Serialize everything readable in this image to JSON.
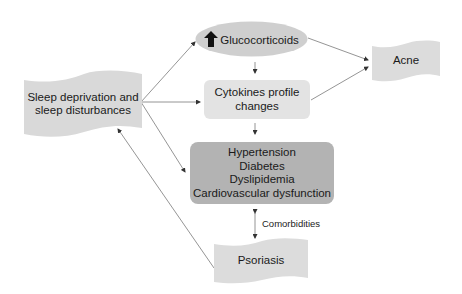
{
  "diagram": {
    "nodes": {
      "sleep": {
        "label_line1": "Sleep deprivation and",
        "label_line2": "sleep disturbances",
        "shape": "wave",
        "fill": "#d9d9d9"
      },
      "glucocorticoids": {
        "label": "Glucocorticoids",
        "prefix_icon": "up-arrow-icon",
        "shape": "ellipse",
        "fill": "#cfcfcf"
      },
      "acne": {
        "label": "Acne",
        "shape": "wave",
        "fill": "#dcdcdc"
      },
      "cytokines": {
        "label_line1": "Cytokines profile",
        "label_line2": "changes",
        "shape": "rounded-rect",
        "fill": "#e3e3e3"
      },
      "comorbid": {
        "line1": "Hypertension",
        "line2": "Diabetes",
        "line3": "Dyslipidemia",
        "line4": "Cardiovascular dysfunction",
        "shape": "rounded-rect",
        "fill": "#b3b3b3"
      },
      "psoriasis": {
        "label": "Psoriasis",
        "shape": "wave",
        "fill": "#dcdcdc"
      }
    },
    "edge_labels": {
      "comorbidities": "Comorbidities"
    },
    "edges": [
      {
        "from": "sleep",
        "to": "glucocorticoids"
      },
      {
        "from": "sleep",
        "to": "cytokines"
      },
      {
        "from": "sleep",
        "to": "comorbid"
      },
      {
        "from": "glucocorticoids",
        "to": "cytokines"
      },
      {
        "from": "glucocorticoids",
        "to": "acne"
      },
      {
        "from": "cytokines",
        "to": "acne"
      },
      {
        "from": "cytokines",
        "to": "comorbid"
      },
      {
        "from": "comorbid",
        "to": "psoriasis",
        "bidirectional": true,
        "label": "Comorbidities"
      },
      {
        "from": "psoriasis",
        "to": "sleep"
      }
    ],
    "colors": {
      "line": "#6e6e6e",
      "text": "#1a1a1a"
    }
  }
}
